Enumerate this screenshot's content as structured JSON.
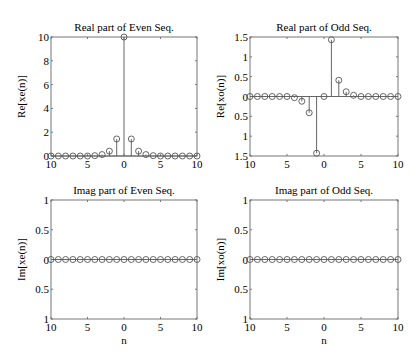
{
  "figure": {
    "background": "#ffffff",
    "line_color": "#666666",
    "marker_color": "#555555"
  },
  "chart_data": [
    {
      "type": "stem",
      "title": "Real part of Even Seq.",
      "xlabel": "",
      "ylabel": "Re[xe(n)]",
      "xlim": [
        -10,
        10
      ],
      "ylim": [
        0,
        10
      ],
      "xticks": [
        -10,
        -5,
        0,
        5,
        10
      ],
      "xtick_labels": [
        "10",
        "5",
        "0",
        "5",
        "10"
      ],
      "yticks": [
        0,
        2,
        4,
        6,
        8,
        10
      ],
      "ytick_labels": [
        "0",
        "2",
        "4",
        "6",
        "8",
        "10"
      ],
      "x": [
        -10,
        -9,
        -8,
        -7,
        -6,
        -5,
        -4,
        -3,
        -2,
        -1,
        0,
        1,
        2,
        3,
        4,
        5,
        6,
        7,
        8,
        9,
        10
      ],
      "values": [
        0,
        0,
        0,
        0,
        0,
        0,
        0.03,
        0.12,
        0.41,
        1.43,
        10,
        1.43,
        0.41,
        0.12,
        0.03,
        0,
        0,
        0,
        0,
        0,
        0
      ],
      "box": {
        "x0": 51,
        "y0": 37,
        "x1": 197,
        "y1": 156
      }
    },
    {
      "type": "stem",
      "title": "Real part of Odd Seq.",
      "xlabel": "",
      "ylabel": "Re[xo(n)]",
      "xlim": [
        -10,
        10
      ],
      "ylim": [
        -1.5,
        1.5
      ],
      "xticks": [
        -10,
        -5,
        0,
        5,
        10
      ],
      "xtick_labels": [
        "10",
        "5",
        "0",
        "5",
        "10"
      ],
      "yticks": [
        -1.5,
        -1,
        -0.5,
        0,
        0.5,
        1,
        1.5
      ],
      "ytick_labels": [
        "1.5",
        "1",
        "0.5",
        "0",
        "0.5",
        "1",
        "1.5"
      ],
      "x": [
        -10,
        -9,
        -8,
        -7,
        -6,
        -5,
        -4,
        -3,
        -2,
        -1,
        0,
        1,
        2,
        3,
        4,
        5,
        6,
        7,
        8,
        9,
        10
      ],
      "values": [
        0,
        0,
        0,
        0,
        0,
        0,
        -0.03,
        -0.12,
        -0.41,
        -1.43,
        0,
        1.43,
        0.41,
        0.12,
        0.03,
        0,
        0,
        0,
        0,
        0,
        0
      ],
      "box": {
        "x0": 250,
        "y0": 37,
        "x1": 398,
        "y1": 156
      }
    },
    {
      "type": "stem",
      "title": "Imag part of Even Seq.",
      "xlabel": "n",
      "ylabel": "Im[xe(n)]",
      "xlim": [
        -10,
        10
      ],
      "ylim": [
        -1,
        1
      ],
      "xticks": [
        -10,
        -5,
        0,
        5,
        10
      ],
      "xtick_labels": [
        "10",
        "5",
        "0",
        "5",
        "10"
      ],
      "yticks": [
        -1,
        -0.5,
        0,
        0.5,
        1
      ],
      "ytick_labels": [
        "1",
        "0.5",
        "0",
        "0.5",
        "1"
      ],
      "x": [
        -10,
        -9,
        -8,
        -7,
        -6,
        -5,
        -4,
        -3,
        -2,
        -1,
        0,
        1,
        2,
        3,
        4,
        5,
        6,
        7,
        8,
        9,
        10
      ],
      "values": [
        0,
        0,
        0,
        0,
        0,
        0,
        0,
        0,
        0,
        0,
        0,
        0,
        0,
        0,
        0,
        0,
        0,
        0,
        0,
        0,
        0
      ],
      "box": {
        "x0": 51,
        "y0": 200,
        "x1": 197,
        "y1": 319
      }
    },
    {
      "type": "stem",
      "title": "Imag part of Odd Seq.",
      "xlabel": "n",
      "ylabel": "Im[xo(n)]",
      "xlim": [
        -10,
        10
      ],
      "ylim": [
        -1,
        1
      ],
      "xticks": [
        -10,
        -5,
        0,
        5,
        10
      ],
      "xtick_labels": [
        "10",
        "5",
        "0",
        "5",
        "10"
      ],
      "yticks": [
        -1,
        -0.5,
        0,
        0.5,
        1
      ],
      "ytick_labels": [
        "1",
        "0.5",
        "0",
        "0.5",
        "1"
      ],
      "x": [
        -10,
        -9,
        -8,
        -7,
        -6,
        -5,
        -4,
        -3,
        -2,
        -1,
        0,
        1,
        2,
        3,
        4,
        5,
        6,
        7,
        8,
        9,
        10
      ],
      "values": [
        0,
        0,
        0,
        0,
        0,
        0,
        0,
        0,
        0,
        0,
        0,
        0,
        0,
        0,
        0,
        0,
        0,
        0,
        0,
        0,
        0
      ],
      "box": {
        "x0": 250,
        "y0": 200,
        "x1": 398,
        "y1": 319
      }
    }
  ]
}
